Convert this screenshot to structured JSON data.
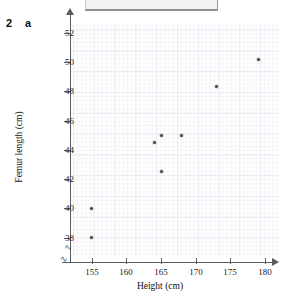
{
  "question": {
    "number": "2",
    "part": "a"
  },
  "chart_data": {
    "type": "scatter",
    "title": "",
    "xlabel": "Height (cm)",
    "ylabel": "Femur length (cm)",
    "xlim": [
      152,
      182
    ],
    "ylim": [
      36.6,
      52.6
    ],
    "xticks": [
      155,
      160,
      165,
      170,
      175,
      180
    ],
    "yticks": [
      38,
      40,
      42,
      44,
      46,
      48,
      50,
      52
    ],
    "grid": true,
    "axis_break_x": true,
    "axis_break_y": true,
    "legend": "none",
    "points": [
      {
        "x": 155,
        "y": 38
      },
      {
        "x": 155,
        "y": 40
      },
      {
        "x": 164,
        "y": 44.5
      },
      {
        "x": 165,
        "y": 45
      },
      {
        "x": 165,
        "y": 42.5
      },
      {
        "x": 168,
        "y": 45
      },
      {
        "x": 173,
        "y": 48.3
      },
      {
        "x": 179,
        "y": 50.2
      }
    ]
  }
}
